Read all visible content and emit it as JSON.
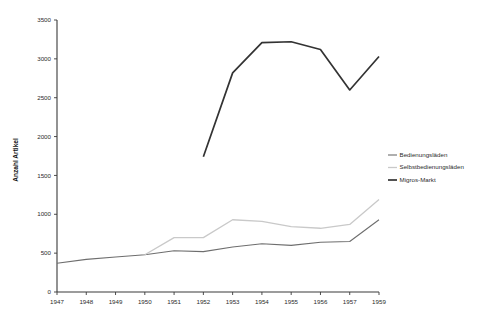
{
  "chart_data": {
    "type": "line",
    "title": "",
    "subtitle": "",
    "xlabel": "",
    "ylabel": "Anzahl Artikel",
    "categories": [
      "1947",
      "1948",
      "1949",
      "1950",
      "1951",
      "1952",
      "1953",
      "1954",
      "1955",
      "1956",
      "1957",
      "1959"
    ],
    "x": [
      1947,
      1948,
      1949,
      1950,
      1951,
      1952,
      1953,
      1954,
      1955,
      1956,
      1957,
      1959
    ],
    "ylim": [
      0,
      3500
    ],
    "yticks": [
      0,
      500,
      1000,
      1500,
      2000,
      2500,
      3000,
      3500
    ],
    "ytick_labels": [
      "0",
      "500",
      "1000",
      "1500",
      "2000",
      "2500",
      "3000",
      "3500"
    ],
    "grid": false,
    "legend_position": "right",
    "series": [
      {
        "name": "Bedienungsläden",
        "color": "#6e6e6e",
        "width": 1.1,
        "values": [
          370,
          420,
          450,
          480,
          530,
          520,
          580,
          620,
          600,
          640,
          650,
          930
        ]
      },
      {
        "name": "Selbstbedienungsläden",
        "color": "#c9c9c9",
        "width": 1.3,
        "values": [
          null,
          null,
          null,
          480,
          700,
          700,
          930,
          910,
          840,
          820,
          870,
          1190
        ]
      },
      {
        "name": "Migros-Markt",
        "color": "#333333",
        "width": 1.7,
        "values": [
          null,
          null,
          null,
          null,
          null,
          1740,
          2820,
          3210,
          3220,
          3120,
          2600,
          3030
        ]
      }
    ]
  },
  "legend": {
    "items": [
      {
        "label": "Bedienungsläden"
      },
      {
        "label": "Selbstbedienungsläden"
      },
      {
        "label": "Migros-Markt"
      }
    ]
  }
}
